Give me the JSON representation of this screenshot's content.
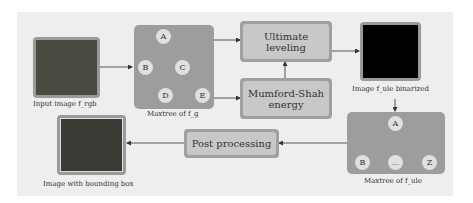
{
  "nodes": {
    "input": {
      "caption": "Input image f_rgb"
    },
    "maxtree_g": {
      "caption": "Maxtree of f_g",
      "labels": [
        "A",
        "B",
        "C",
        "D",
        "E"
      ]
    },
    "ultimate": {
      "label": "Ultimate leveling"
    },
    "mumford": {
      "label": "Mumford-Shah energy"
    },
    "binarized": {
      "caption": "Image f_ule binarized"
    },
    "maxtree_ule": {
      "caption": "Maxtree of f_ule",
      "labels": [
        "A",
        "B",
        "...",
        "Z"
      ]
    },
    "post": {
      "label": "Post processing"
    },
    "output": {
      "caption": "Image with bounding box"
    }
  },
  "colors": {
    "panel": "#eeeeee",
    "box": "#9d9d9d",
    "process": "#c8c8c8"
  }
}
